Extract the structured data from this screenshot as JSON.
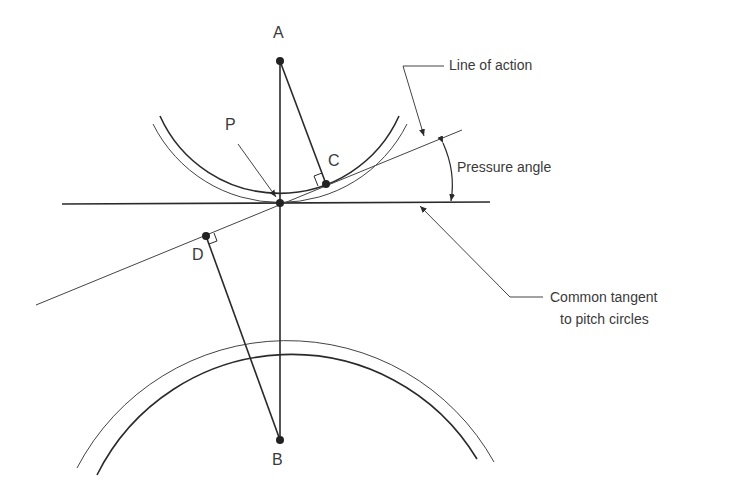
{
  "diagram": {
    "points": {
      "A": {
        "label": "A",
        "x": 280,
        "y": 61
      },
      "B": {
        "label": "B",
        "x": 280,
        "y": 440
      },
      "C": {
        "label": "C",
        "x": 326,
        "y": 184
      },
      "D": {
        "label": "D",
        "x": 206,
        "y": 236
      },
      "P": {
        "label": "P",
        "x": 280,
        "y": 203
      }
    },
    "annotations": {
      "line_of_action": "Line of action",
      "pressure_angle": "Pressure angle",
      "common_tangent_line1": "Common tangent",
      "common_tangent_line2": "to pitch circles"
    },
    "colors": {
      "ink": "#2a2a2a",
      "text": "#3a3a3a",
      "background": "#ffffff"
    }
  }
}
